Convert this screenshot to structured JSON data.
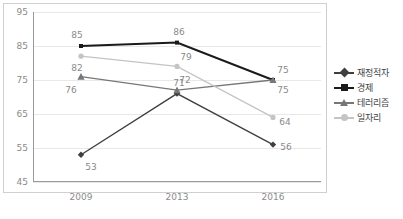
{
  "chart_data": {
    "type": "line",
    "title": "",
    "xlabel": "",
    "ylabel": "",
    "categories": [
      "2009",
      "2013",
      "2016"
    ],
    "ylim": [
      45,
      95
    ],
    "yticks": [
      45,
      55,
      65,
      75,
      85,
      95
    ],
    "grid": true,
    "legend_position": "right",
    "series": [
      {
        "name": "재정적자",
        "values": [
          53,
          71,
          56
        ],
        "marker": "diamond",
        "color": "#3f3f3f"
      },
      {
        "name": "경제",
        "values": [
          85,
          86,
          75
        ],
        "marker": "square",
        "color": "#1a1a1a"
      },
      {
        "name": "테러리즘",
        "values": [
          76,
          72,
          75
        ],
        "marker": "triangle",
        "color": "#777777"
      },
      {
        "name": "일자리",
        "values": [
          82,
          79,
          64
        ],
        "marker": "circle",
        "color": "#c4c4c4"
      }
    ],
    "point_labels": [
      {
        "text": "53",
        "series": "재정적자",
        "category": "2009",
        "value": 53
      },
      {
        "text": "71",
        "series": "재정적자",
        "category": "2013",
        "value": 71
      },
      {
        "text": "56",
        "series": "재정적자",
        "category": "2016",
        "value": 56
      },
      {
        "text": "85",
        "series": "경제",
        "category": "2009",
        "value": 85
      },
      {
        "text": "86",
        "series": "경제",
        "category": "2013",
        "value": 86
      },
      {
        "text": "75",
        "series": "경제",
        "category": "2016",
        "value": 75
      },
      {
        "text": "76",
        "series": "테러리즘",
        "category": "2009",
        "value": 76
      },
      {
        "text": "72",
        "series": "테러리즘",
        "category": "2013",
        "value": 72
      },
      {
        "text": "75",
        "series": "테러리즘",
        "category": "2016",
        "value": 75
      },
      {
        "text": "82",
        "series": "일자리",
        "category": "2009",
        "value": 82
      },
      {
        "text": "79",
        "series": "일자리",
        "category": "2013",
        "value": 79
      },
      {
        "text": "64",
        "series": "일자리",
        "category": "2016",
        "value": 64
      }
    ]
  },
  "axes": {
    "y_tick_labels": [
      "95",
      "85",
      "75",
      "65",
      "55",
      "45"
    ],
    "x_tick_labels": [
      "2009",
      "2013",
      "2016"
    ]
  },
  "legend": {
    "entries": [
      {
        "label": "재정적자"
      },
      {
        "label": "경제"
      },
      {
        "label": "테러리즘"
      },
      {
        "label": "일자리"
      }
    ]
  },
  "colors": {
    "grid": "#e8e8e8",
    "axis": "#9a9a9a",
    "frame": "#d0d0d0",
    "tick_text": "#8a8a8a",
    "legend_text": "#3f3f3f"
  }
}
